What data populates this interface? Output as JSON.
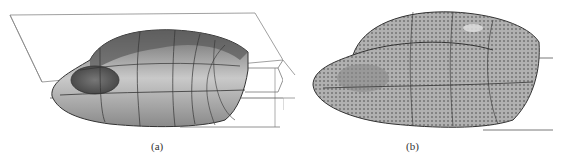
{
  "figure": {
    "panels": [
      {
        "id": "a",
        "caption": "(a)",
        "description": "shaded surface model with boundary curve network and bounding planes"
      },
      {
        "id": "b",
        "caption": "(b)",
        "description": "surface model with dense sample point grid overlay"
      }
    ],
    "colors": {
      "surface_light": "#c8c8c8",
      "surface_mid": "#9a9a9a",
      "surface_dark": "#555555",
      "wire": "#333333",
      "plane": "#777777"
    }
  }
}
